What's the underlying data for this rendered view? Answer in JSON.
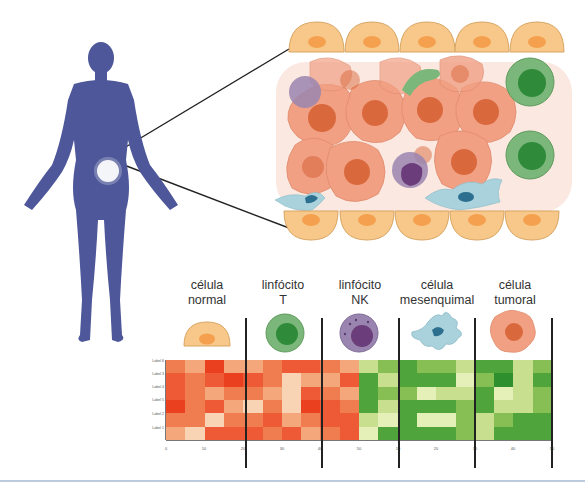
{
  "figure": {
    "body_figure": {
      "label": "human-body-silhouette",
      "color": "#4d5799",
      "highlight_color": "#ffffff"
    },
    "tissue": {
      "label": "tumor-microenvironment-tissue",
      "colors": {
        "epithelial": "#f8c88a",
        "epithelial_nucleus": "#f4a04e",
        "tumor": "#f1a084",
        "tumor_nucleus": "#d9693d",
        "t_cell": "#7bb77a",
        "t_cell_nucleus": "#2f8a3a",
        "nk_cell": "#9a85b0",
        "nk_cell_nucleus": "#6b3d7a",
        "mesenchymal": "#a9d2dc",
        "mesenchymal_nucleus": "#2d6f8e"
      }
    },
    "cell_types": [
      {
        "line1": "célula",
        "line2": "normal",
        "icon": "normal-cell-icon"
      },
      {
        "line1": "linfócito",
        "line2": "T",
        "icon": "t-lymphocyte-icon"
      },
      {
        "line1": "linfócito",
        "line2": "NK",
        "icon": "nk-lymphocyte-icon"
      },
      {
        "line1": "célula",
        "line2": "mesenquimal",
        "icon": "mesenchymal-cell-icon"
      },
      {
        "line1": "célula",
        "line2": "tumoral",
        "icon": "tumor-cell-icon"
      }
    ]
  },
  "chart_data": {
    "type": "heatmap",
    "title": "",
    "xlabel": "",
    "ylabel": "",
    "row_labels": [
      "Label 6",
      "Label 3",
      "Label 4",
      "Label 5",
      "Label 2",
      "Label 1"
    ],
    "x_ticks": [
      "0",
      "10",
      "20",
      "30",
      "40",
      "50",
      "10",
      "20",
      "30",
      "40",
      "50"
    ],
    "groups": [
      "célula normal",
      "linfócito T",
      "linfócito NK",
      "célula mesenquimal",
      "célula tumoral"
    ],
    "color_scale": {
      "red": [
        "#f8d4b4",
        "#f4a77a",
        "#f07d50",
        "#ee5a36",
        "#ea4020"
      ],
      "green": [
        "#e5f0b8",
        "#c7df8f",
        "#88bf55",
        "#4fa53c",
        "#2e8f2f"
      ]
    },
    "legend": "none",
    "grid": false,
    "cells": [
      [
        "r2",
        "r1",
        "r4",
        "r1",
        "r1",
        "r2",
        "r3",
        "r3",
        "r2",
        "r1",
        "g1",
        "g2",
        "g3",
        "g2",
        "g2",
        "g1",
        "g3",
        "g3",
        "g1",
        "g2"
      ],
      [
        "r3",
        "r2",
        "r3",
        "r4",
        "r3",
        "r2",
        "r0",
        "r1",
        "r1",
        "r3",
        "g3",
        "g1",
        "g3",
        "g3",
        "g3",
        "g0",
        "g2",
        "g4",
        "g1",
        "g3"
      ],
      [
        "r3",
        "r2",
        "r1",
        "r2",
        "r2",
        "r1",
        "r0",
        "r3",
        "r2",
        "r1",
        "g3",
        "g2",
        "g2",
        "g0",
        "g1",
        "g1",
        "g3",
        "g0",
        "g1",
        "g2"
      ],
      [
        "r4",
        "r2",
        "r3",
        "r1",
        "r0",
        "r2",
        "r0",
        "r4",
        "r3",
        "r2",
        "g3",
        "g1",
        "g3",
        "g3",
        "g3",
        "g2",
        "g3",
        "g1",
        "g1",
        "g2"
      ],
      [
        "r2",
        "r2",
        "r0",
        "r2",
        "r2",
        "r3",
        "r1",
        "r2",
        "r3",
        "r3",
        "g1",
        "g0",
        "g3",
        "g0",
        "g0",
        "g2",
        "g1",
        "g2",
        "g3",
        "g3"
      ],
      [
        "r1",
        "r0",
        "r3",
        "r3",
        "r3",
        "r2",
        "r3",
        "r1",
        "r2",
        "r3",
        "g0",
        "g3",
        "g3",
        "g3",
        "g3",
        "g2",
        "g1",
        "g3",
        "g3",
        "g3"
      ]
    ]
  }
}
